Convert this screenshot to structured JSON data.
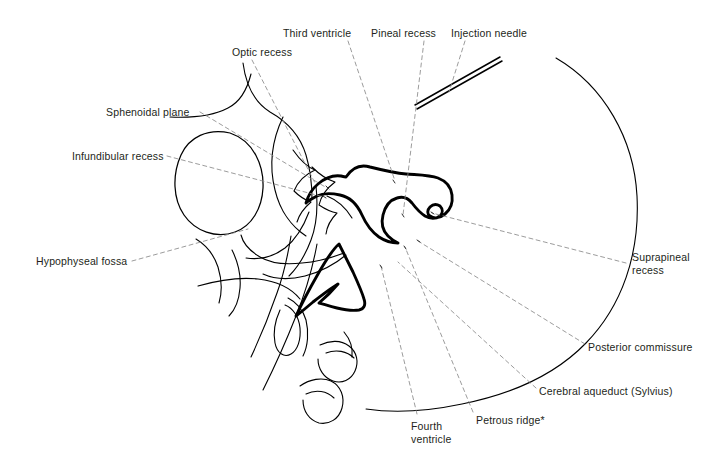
{
  "figure": {
    "kind": "line-drawing-anatomical-diagram",
    "background_color": "#ffffff",
    "ink_color": "#000000",
    "text_color": "#231f20",
    "leader_color": "#8a8a8a",
    "width": 727,
    "height": 472
  },
  "labels": [
    {
      "id": "optic-recess",
      "text": "Optic recess",
      "x": 232,
      "y": 46,
      "align": "left"
    },
    {
      "id": "third-ventricle",
      "text": "Third ventricle",
      "x": 283,
      "y": 27,
      "align": "left"
    },
    {
      "id": "pineal-recess",
      "text": "Pineal recess",
      "x": 371,
      "y": 27,
      "align": "left"
    },
    {
      "id": "injection-needle",
      "text": "Injection needle",
      "x": 451,
      "y": 27,
      "align": "left"
    },
    {
      "id": "sphenoidal-plane",
      "text": "Sphenoidal plane",
      "x": 106,
      "y": 106,
      "align": "left"
    },
    {
      "id": "infundibular-recess",
      "text": "Infundibular recess",
      "x": 72,
      "y": 150,
      "align": "left"
    },
    {
      "id": "hypophyseal-fossa",
      "text": "Hypophyseal fossa",
      "x": 36,
      "y": 255,
      "align": "left"
    },
    {
      "id": "suprapineal-recess",
      "text": "Suprapineal\nrecess",
      "x": 632,
      "y": 251,
      "align": "left"
    },
    {
      "id": "posterior-commissure",
      "text": "Posterior commissure",
      "x": 588,
      "y": 341,
      "align": "left"
    },
    {
      "id": "cerebral-aqueduct",
      "text": "Cerebral aqueduct (Sylvius)",
      "x": 539,
      "y": 385,
      "align": "left"
    },
    {
      "id": "petrous-ridge",
      "text": "Petrous ridge*",
      "x": 476,
      "y": 414,
      "align": "left"
    },
    {
      "id": "fourth-ventricle",
      "text": "Fourth\nventricle",
      "x": 411,
      "y": 420,
      "align": "left"
    }
  ],
  "leaders": [
    {
      "id": "leader-optic-recess",
      "from": [
        252,
        60
      ],
      "to": [
        315,
        183
      ]
    },
    {
      "id": "leader-third-ventricle",
      "from": [
        348,
        41
      ],
      "to": [
        395,
        181
      ]
    },
    {
      "id": "leader-pineal-recess",
      "from": [
        424,
        41
      ],
      "to": [
        403,
        215
      ]
    },
    {
      "id": "leader-injection-needle",
      "from": [
        465,
        41
      ],
      "to": [
        449,
        92
      ]
    },
    {
      "id": "leader-sphenoidal-plane",
      "from": [
        200,
        112
      ],
      "to": [
        327,
        188
      ]
    },
    {
      "id": "leader-infundibular-recess",
      "from": [
        167,
        156
      ],
      "to": [
        324,
        197
      ]
    },
    {
      "id": "leader-hypophyseal-fossa",
      "from": [
        132,
        261
      ],
      "to": [
        248,
        229
      ]
    },
    {
      "id": "leader-suprapineal-recess",
      "from": [
        626,
        263
      ],
      "to": [
        432,
        213
      ]
    },
    {
      "id": "leader-posterior-commissure",
      "from": [
        585,
        344
      ],
      "to": [
        418,
        241
      ]
    },
    {
      "id": "leader-cerebral-aqueduct",
      "from": [
        536,
        388
      ],
      "to": [
        398,
        262
      ]
    },
    {
      "id": "leader-petrous-ridge",
      "from": [
        473,
        412
      ],
      "to": [
        405,
        247
      ]
    },
    {
      "id": "leader-fourth-ventricle",
      "from": [
        417,
        414
      ],
      "to": [
        381,
        266
      ]
    }
  ],
  "structures": [
    {
      "id": "skull-vault-arc",
      "kind": "thin-curve",
      "note": "large posterior cranial outline arc"
    },
    {
      "id": "orbit-ring",
      "kind": "thin-closed-curve",
      "note": "rounded orbital outline at left"
    },
    {
      "id": "sphenoid-sinus-outline",
      "kind": "thin-curve"
    },
    {
      "id": "sella-clivus-outline",
      "kind": "thin-curve"
    },
    {
      "id": "third-ventricle-outline",
      "kind": "bold-closed-curve"
    },
    {
      "id": "fourth-ventricle-outline",
      "kind": "bold-closed-curve"
    },
    {
      "id": "injection-needle-shaft",
      "kind": "bold-double-line"
    },
    {
      "id": "cervical-vertebrae",
      "kind": "thin-curves"
    }
  ]
}
